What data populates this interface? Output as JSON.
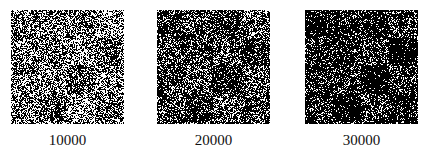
{
  "figure": {
    "panels": [
      {
        "label": "10000",
        "density": 0.55,
        "left": 11
      },
      {
        "label": "20000",
        "density": 0.72,
        "left": 157
      },
      {
        "label": "30000",
        "density": 0.82,
        "left": 305
      }
    ],
    "colors": {
      "foreground": "#000000",
      "background": "#ffffff"
    }
  }
}
